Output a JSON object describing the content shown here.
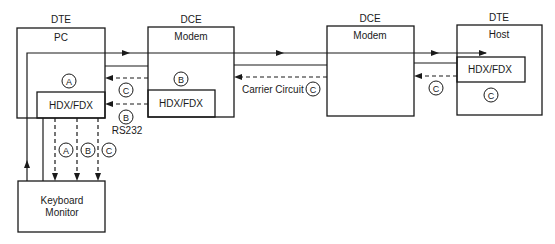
{
  "diagram": {
    "nodes": {
      "pc": {
        "role": "DTE",
        "name": "PC",
        "inner": "HDX/FDX",
        "circle": "A"
      },
      "modem1": {
        "role": "DCE",
        "name": "Modem",
        "inner": "HDX/FDX",
        "circle": "B"
      },
      "modem2": {
        "role": "DCE",
        "name": "Modem"
      },
      "host": {
        "role": "DTE",
        "name": "Host",
        "inner": "HDX/FDX",
        "circle": "C"
      },
      "keyboard": {
        "line1": "Keyboard",
        "line2": "Monitor"
      }
    },
    "labels": {
      "rs232": "RS232",
      "carrier_circuit": "Carrier Circuit",
      "circle_c_pc_modem": "C",
      "circle_b_rs232": "B",
      "circle_c_carrier": "C",
      "circle_c_host_link": "C",
      "kb_circle_a": "A",
      "kb_circle_b": "B",
      "kb_circle_c": "C"
    }
  }
}
